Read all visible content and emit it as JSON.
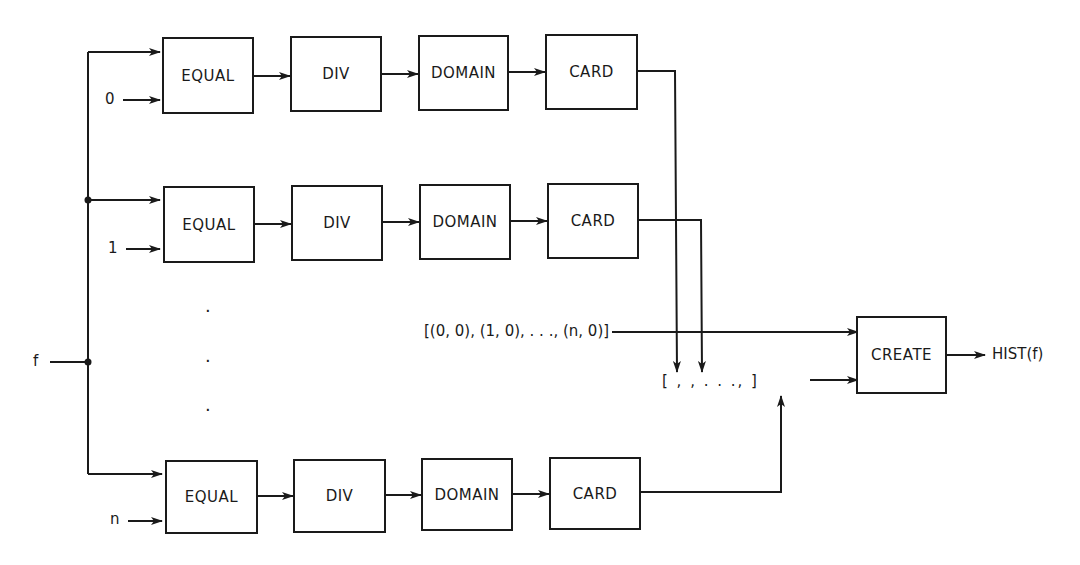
{
  "diagram": {
    "input_label": "f",
    "rows": [
      {
        "index_label": "0",
        "blocks": [
          "EQUAL",
          "DIV",
          "DOMAIN",
          "CARD"
        ]
      },
      {
        "index_label": "1",
        "blocks": [
          "EQUAL",
          "DIV",
          "DOMAIN",
          "CARD"
        ]
      },
      {
        "index_label": "n",
        "blocks": [
          "EQUAL",
          "DIV",
          "DOMAIN",
          "CARD"
        ]
      }
    ],
    "ellipsis_dots": [
      "·",
      "·",
      "·"
    ],
    "initial_list": "[(0, 0), (1, 0), . . ., (n, 0)]",
    "result_list": "[   ,   ,   . . .,      ]",
    "create_block": "CREATE",
    "output_label": "HIST(f)"
  }
}
